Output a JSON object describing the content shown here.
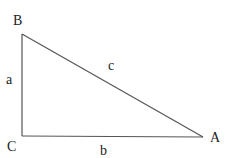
{
  "diagram": {
    "type": "right-triangle",
    "vertices": [
      {
        "label": "B",
        "x": 22,
        "y": 34,
        "label_x": 13,
        "label_y": 25
      },
      {
        "label": "C",
        "x": 22,
        "y": 136,
        "label_x": 7,
        "label_y": 151
      },
      {
        "label": "A",
        "x": 203,
        "y": 137,
        "label_x": 210,
        "label_y": 142
      }
    ],
    "sides": [
      {
        "label": "a",
        "between": "B-C",
        "label_x": 6,
        "label_y": 84
      },
      {
        "label": "b",
        "between": "C-A",
        "label_x": 100,
        "label_y": 155
      },
      {
        "label": "c",
        "between": "B-A",
        "label_x": 108,
        "label_y": 70
      }
    ],
    "line_color": "#555555",
    "text_color": "#222222"
  }
}
